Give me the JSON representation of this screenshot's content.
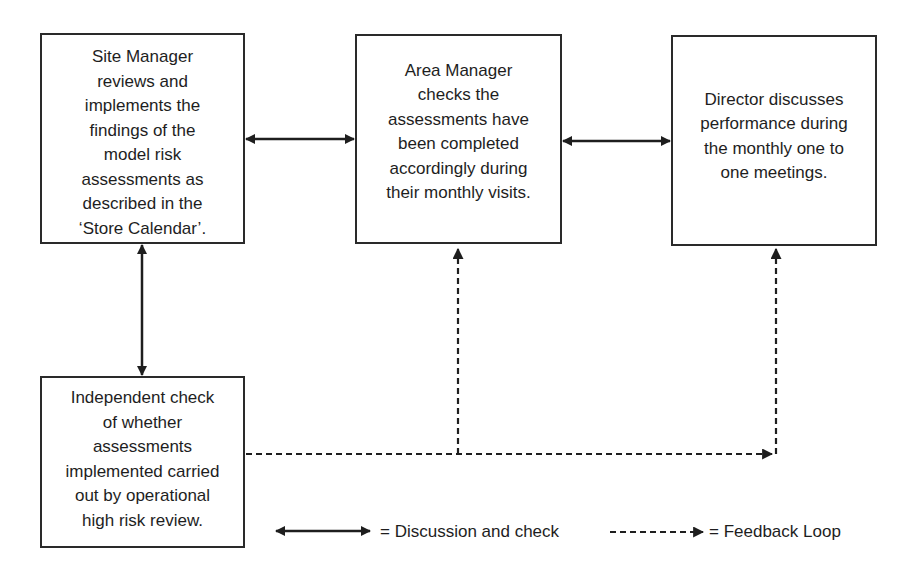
{
  "boxes": {
    "site_manager": {
      "lines": [
        "Site Manager",
        "reviews and",
        "implements the",
        "findings of the",
        "model risk",
        "assessments as",
        "described in the",
        "‘Store Calendar’."
      ]
    },
    "area_manager": {
      "lines": [
        "Area Manager",
        "checks the",
        "assessments have",
        "been completed",
        "accordingly during",
        "their monthly visits."
      ]
    },
    "director": {
      "lines": [
        "Director discusses",
        "performance during",
        "the monthly one to",
        "one meetings."
      ]
    },
    "independent_check": {
      "lines": [
        "Independent check",
        "of whether",
        "assessments",
        "implemented carried",
        "out by operational",
        "high risk review."
      ]
    }
  },
  "connectors": [
    {
      "from": "site_manager",
      "to": "area_manager",
      "type": "double-arrow-solid"
    },
    {
      "from": "area_manager",
      "to": "director",
      "type": "double-arrow-solid"
    },
    {
      "from": "site_manager",
      "to": "independent_check",
      "type": "double-arrow-solid"
    },
    {
      "from": "independent_check",
      "to": "area_manager",
      "type": "dashed-arrow"
    },
    {
      "from": "independent_check",
      "to": "director",
      "type": "dashed-arrow"
    }
  ],
  "legend": {
    "discussion": {
      "icon": "double-arrow-solid",
      "label": "= Discussion and check"
    },
    "feedback": {
      "icon": "dashed-arrow",
      "label": "= Feedback Loop"
    }
  },
  "colors": {
    "line": "#1e1e1e",
    "box_border": "#2a2a2a",
    "background": "#ffffff"
  }
}
